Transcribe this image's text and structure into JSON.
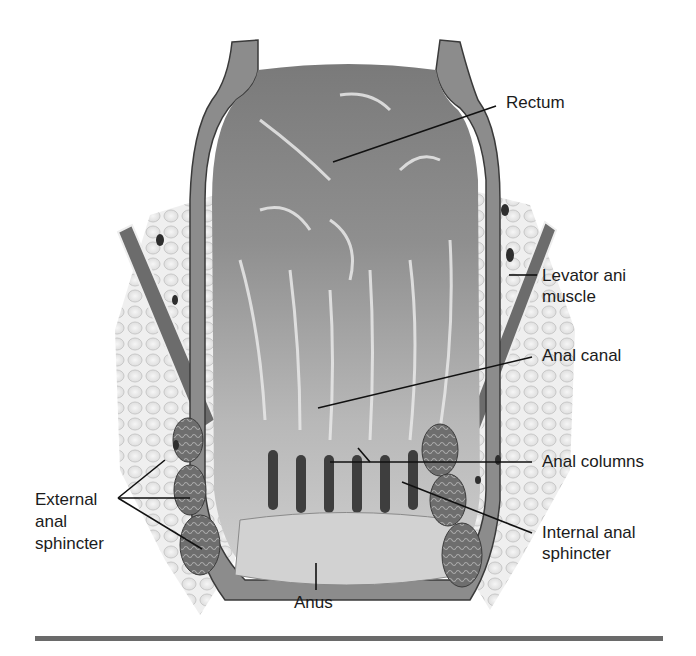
{
  "figure": {
    "style": "grayscale medical illustration",
    "colors": {
      "background": "#ffffff",
      "tissue_dark": "#5a5a5a",
      "tissue_mid": "#9a9a9a",
      "tissue_light": "#d6d6d6",
      "fat": "#eeeeee",
      "leader_line": "#111111",
      "rule": "#6a6a6a"
    },
    "labels": {
      "rectum": "Rectum",
      "levator_line1": "Levator ani",
      "levator_line2": "muscle",
      "anal_canal": "Anal canal",
      "anal_columns": "Anal columns",
      "internal_line1": "Internal anal",
      "internal_line2": "sphincter",
      "external_line1": "External",
      "external_line2": "anal",
      "external_line3": "sphincter",
      "anus": "Anus"
    }
  }
}
